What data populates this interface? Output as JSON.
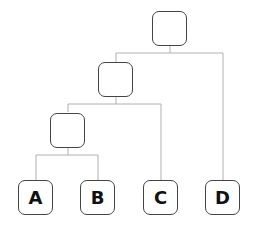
{
  "diagram": {
    "type": "tree",
    "line_color": "#b0b0b0",
    "border_color": "#444444",
    "nodes": [
      {
        "id": "root",
        "label": ""
      },
      {
        "id": "n1",
        "label": ""
      },
      {
        "id": "n2",
        "label": ""
      },
      {
        "id": "A",
        "label": "A"
      },
      {
        "id": "B",
        "label": "B"
      },
      {
        "id": "C",
        "label": "C"
      },
      {
        "id": "D",
        "label": "D"
      }
    ],
    "edges": [
      [
        "root",
        "n1"
      ],
      [
        "root",
        "D"
      ],
      [
        "n1",
        "n2"
      ],
      [
        "n1",
        "C"
      ],
      [
        "n2",
        "A"
      ],
      [
        "n2",
        "B"
      ]
    ]
  }
}
